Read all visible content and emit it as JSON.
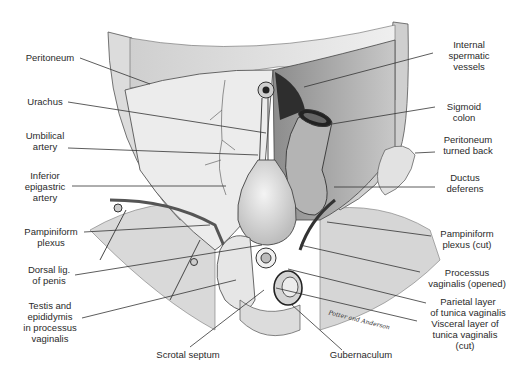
{
  "figure": {
    "type": "anatomical illustration",
    "signature": "Potter and Anderson",
    "labels_left": [
      {
        "id": "peritoneum",
        "text": "Peritoneum"
      },
      {
        "id": "urachus",
        "text": "Urachus"
      },
      {
        "id": "umbilical-artery",
        "text": "Umbilical\nartery"
      },
      {
        "id": "inferior-epigastric-artery",
        "text": "Inferior\nepigastric\nartery"
      },
      {
        "id": "pampiniform-plexus",
        "text": "Pampiniform\nplexus"
      },
      {
        "id": "dorsal-lig-of-penis",
        "text": "Dorsal lig.\nof penis"
      },
      {
        "id": "testis-and-epididymis",
        "text": "Testis and\nepididymis\nin processus\nvaginalis"
      }
    ],
    "labels_right": [
      {
        "id": "internal-spermatic-vessels",
        "text": "Internal\nspermatic\nvessels"
      },
      {
        "id": "sigmoid-colon",
        "text": "Sigmoid\ncolon"
      },
      {
        "id": "peritoneum-turned-back",
        "text": "Peritoneum\nturned back"
      },
      {
        "id": "ductus-deferens",
        "text": "Ductus\ndeferens"
      },
      {
        "id": "pampiniform-plexus-cut",
        "text": "Pampiniform\nplexus (cut)"
      },
      {
        "id": "processus-vaginalis-opened",
        "text": "Processus\nvaginalis (opened)"
      },
      {
        "id": "parietal-layer",
        "text": "Parietal layer\nof tunica vaginalis"
      },
      {
        "id": "visceral-layer",
        "text": "Visceral layer of\ntunica vaginalis\n(cut)"
      }
    ],
    "labels_bottom": [
      {
        "id": "scrotal-septum",
        "text": "Scrotal septum"
      },
      {
        "id": "gubernaculum",
        "text": "Gubernaculum"
      }
    ]
  }
}
